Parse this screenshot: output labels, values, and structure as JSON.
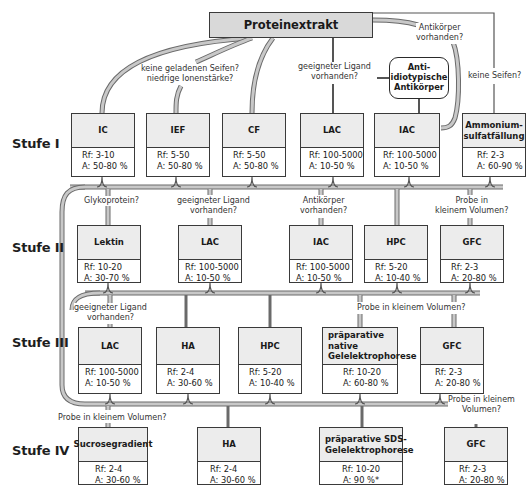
{
  "root": {
    "label": "Proteinextrakt"
  },
  "side_node": {
    "label_lines": [
      "Anti-",
      "idiotypische",
      "Antikörper"
    ]
  },
  "stages": [
    {
      "label": "Stufe I"
    },
    {
      "label": "Stufe II"
    },
    {
      "label": "Stufe III"
    },
    {
      "label": "Stufe IV"
    }
  ],
  "nodes": {
    "s1": [
      {
        "name": "IC",
        "rf": "Rf: 3-10",
        "a": "A: 50-80 %"
      },
      {
        "name": "IEF",
        "rf": "Rf: 5-50",
        "a": "A: 50-80 %"
      },
      {
        "name": "CF",
        "rf": "Rf: 5-50",
        "a": "A: 50-80 %"
      },
      {
        "name": "LAC",
        "rf": "Rf: 100-5000",
        "a": "A: 10-50 %"
      },
      {
        "name": "IAC",
        "rf": "Rf: 100-5000",
        "a": "A: 10-50 %"
      },
      {
        "name": "Ammonium-sulfatfällung",
        "name_lines": [
          "Ammonium-",
          "sulfatfällung"
        ],
        "rf": "Rf: 2-3",
        "a": "A: 60-90 %"
      }
    ],
    "s2": [
      {
        "name": "Lektin",
        "rf": "Rf: 10-20",
        "a": "A: 30-70 %"
      },
      {
        "name": "LAC",
        "rf": "Rf: 100-5000",
        "a": "A: 10-50 %"
      },
      {
        "name": "IAC",
        "rf": "Rf: 100-5000",
        "a": "A: 10-50 %"
      },
      {
        "name": "HPC",
        "rf": "Rf: 5-20",
        "a": "A: 10-40 %"
      },
      {
        "name": "GFC",
        "rf": "Rf: 2-3",
        "a": "A: 20-80 %"
      }
    ],
    "s3": [
      {
        "name": "LAC",
        "rf": "Rf: 100-5000",
        "a": "A: 10-50 %"
      },
      {
        "name": "HA",
        "rf": "Rf: 2-4",
        "a": "A: 30-60 %"
      },
      {
        "name": "HPC",
        "rf": "Rf: 5-20",
        "a": "A: 10-40 %"
      },
      {
        "name": "präparative native Gelelektrophorese",
        "name_lines": [
          "präparative native",
          "Gelelektrophorese"
        ],
        "rf": "Rf: 10-20",
        "a": "A: 60-80 %"
      },
      {
        "name": "GFC",
        "rf": "Rf: 2-3",
        "a": "A: 20-80 %"
      }
    ],
    "s4": [
      {
        "name": "Sucrosegradient",
        "rf": "Rf: 2-4",
        "a": "A: 30-60 %"
      },
      {
        "name": "HA",
        "rf": "Rf: 2-4",
        "a": "A: 30-60 %"
      },
      {
        "name": "präparative SDS-Gelelektrophorese",
        "name_lines": [
          "präparative SDS-",
          "Gelelektrophorese"
        ],
        "rf": "Rf: 10-20",
        "a": "A: 90 %*"
      },
      {
        "name": "GFC",
        "rf": "Rf: 2-3",
        "a": "A: 20-80 %"
      }
    ]
  },
  "conditions": {
    "ief_line1": "keine geladenen Seifen?",
    "ief_line2": "niedrige Ionenstärke?",
    "lac1_line1": "geeigneter Ligand",
    "lac1_line2": "vorhanden?",
    "iac1_line1": "Antikörper",
    "iac1_line2": "vorhanden?",
    "amm_line1": "keine Seifen?",
    "lektin": "Glykoprotein?",
    "lac2_line1": "geeigneter Ligand",
    "lac2_line2": "vorhanden?",
    "iac2_line1": "Antikörper",
    "iac2_line2": "vorhanden?",
    "gfc2_line1": "Probe in",
    "gfc2_line2": "kleinem Volumen?",
    "lac3_line1": "geeigneter Ligand",
    "lac3_line2": "vorhanden?",
    "native3": "Probe in kleinem Volumen?",
    "sucrose4": "Probe in kleinem Volumen?",
    "gfc4_line1": "Probe in kleinem",
    "gfc4_line2": "Volumen?"
  },
  "colors": {
    "line_fill": "#c8c8c8",
    "line_stroke": "#6a6a6a",
    "box_head": "#ececec",
    "root_fill": "#d9d9d9",
    "border": "#3a3a3a"
  }
}
